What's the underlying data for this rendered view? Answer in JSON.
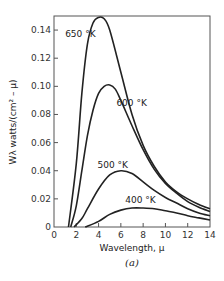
{
  "chart_data": {
    "type": "line",
    "title": "",
    "caption": "(a)",
    "xlabel": "Wavelength, μ",
    "ylabel": "Wλ watts/(cm² – μ)",
    "xlim": [
      0,
      14
    ],
    "ylim": [
      0,
      0.15
    ],
    "grid": false,
    "xticks": [
      0,
      2,
      4,
      6,
      8,
      10,
      12,
      14
    ],
    "yticks": [
      0,
      0.02,
      0.04,
      0.06,
      0.08,
      0.1,
      0.12,
      0.14
    ],
    "ytick_labels": [
      "0",
      "0.02",
      "0.04",
      "0.06",
      "0.08",
      "0.10",
      "0.12",
      "0.14"
    ],
    "xtick_labels": [
      "0",
      "2",
      "4",
      "6",
      "8",
      "10",
      "12",
      "14"
    ],
    "series": [
      {
        "name": "650 °K",
        "x": [
          1.3,
          2,
          2.5,
          3,
          3.5,
          4,
          4.5,
          5,
          6,
          7,
          8,
          9,
          10,
          11,
          12,
          13,
          14
        ],
        "y": [
          0.0,
          0.045,
          0.095,
          0.13,
          0.145,
          0.149,
          0.148,
          0.14,
          0.11,
          0.08,
          0.058,
          0.043,
          0.032,
          0.025,
          0.02,
          0.016,
          0.013
        ]
      },
      {
        "name": "600 °K",
        "x": [
          1.5,
          2,
          2.5,
          3,
          3.5,
          4,
          4.5,
          5,
          5.5,
          6,
          7,
          8,
          9,
          10,
          11,
          12,
          13,
          14
        ],
        "y": [
          0.0,
          0.015,
          0.04,
          0.065,
          0.083,
          0.095,
          0.1,
          0.101,
          0.098,
          0.09,
          0.072,
          0.055,
          0.041,
          0.031,
          0.024,
          0.018,
          0.014,
          0.011
        ]
      },
      {
        "name": "500 °K",
        "x": [
          1.8,
          2.5,
          3,
          4,
          5,
          6,
          7,
          8,
          9,
          10,
          11,
          12,
          13,
          14
        ],
        "y": [
          0.0,
          0.006,
          0.013,
          0.027,
          0.037,
          0.04,
          0.038,
          0.032,
          0.026,
          0.021,
          0.017,
          0.013,
          0.01,
          0.008
        ]
      },
      {
        "name": "400 °K",
        "x": [
          2.8,
          4,
          5,
          6,
          7,
          8,
          9,
          10,
          11,
          12,
          13,
          14
        ],
        "y": [
          0.0,
          0.004,
          0.009,
          0.012,
          0.0135,
          0.0135,
          0.013,
          0.0115,
          0.01,
          0.008,
          0.0065,
          0.005
        ]
      }
    ],
    "annotations": [
      {
        "text": "650 °K",
        "x": 1.0,
        "y": 0.135
      },
      {
        "text": "600 °K",
        "x": 5.6,
        "y": 0.086
      },
      {
        "text": "500 °K",
        "x": 3.9,
        "y": 0.042
      },
      {
        "text": "400 °K",
        "x": 6.4,
        "y": 0.017
      }
    ]
  }
}
